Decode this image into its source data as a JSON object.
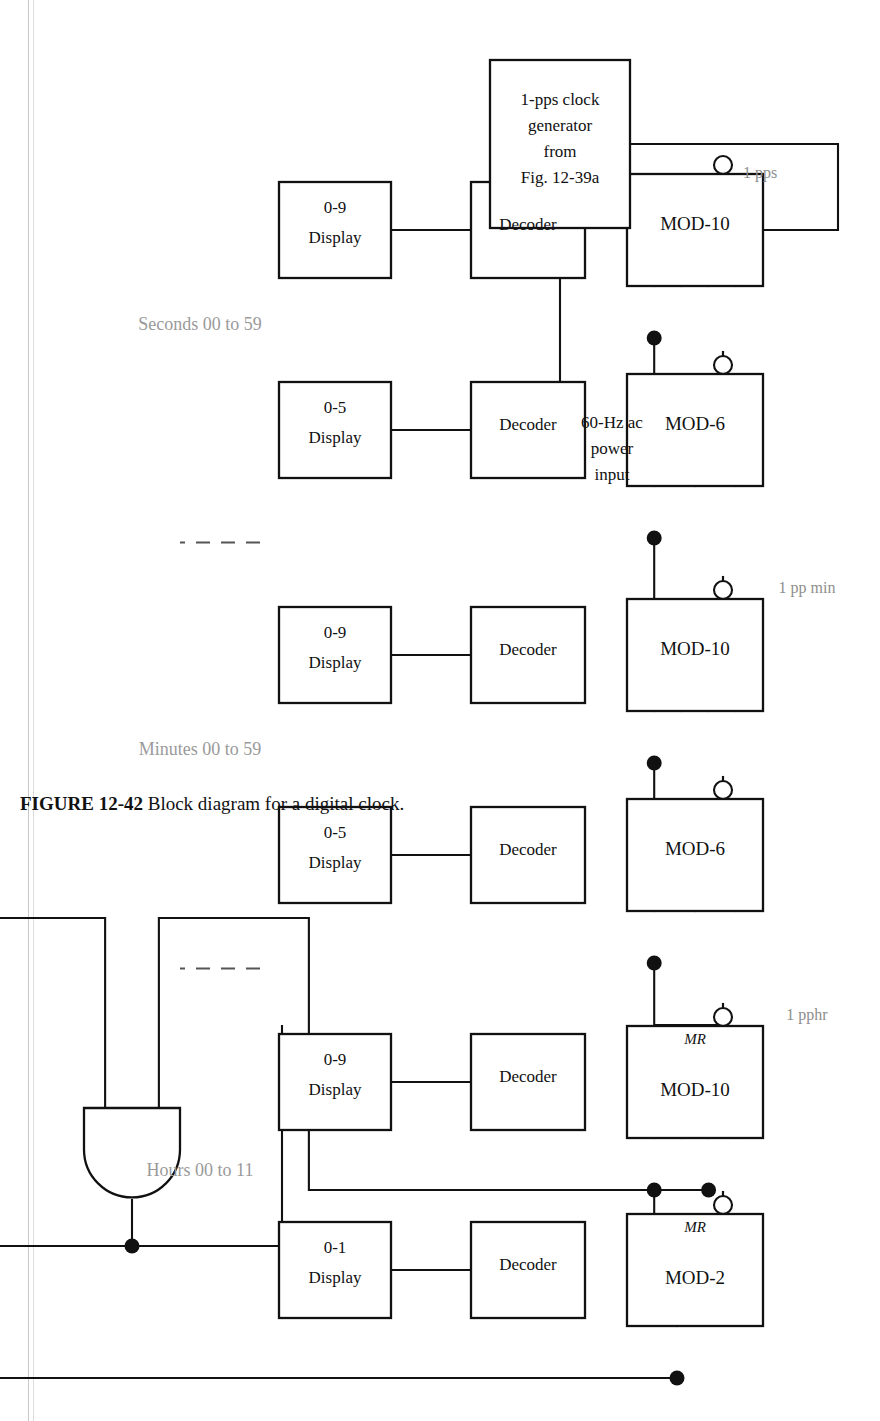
{
  "figure": {
    "caption_number": "FIGURE 12-42",
    "caption_text": "Block diagram for a digital clock."
  },
  "source": {
    "input_label_lines": [
      "60-Hz ac",
      "power",
      "input"
    ],
    "generator_lines": [
      "1-pps clock",
      "generator",
      "from",
      "Fig. 12-39a"
    ]
  },
  "signals": {
    "pps": "1 pps",
    "ppmin": "1 pp min",
    "pphr": "1 pphr"
  },
  "sections": [
    {
      "id": "seconds",
      "label": "Seconds 00 to 59"
    },
    {
      "id": "minutes",
      "label": "Minutes 00 to 59"
    },
    {
      "id": "hours",
      "label": "Hours 00 to 11"
    }
  ],
  "stages": [
    {
      "id": "seconds-units",
      "counter": "MOD-10",
      "mr": null,
      "decoder": "Decoder",
      "display_range": "0-9",
      "display_word": "Display",
      "bus_lines": 4
    },
    {
      "id": "seconds-tens",
      "counter": "MOD-6",
      "mr": null,
      "decoder": "Decoder",
      "display_range": "0-5",
      "display_word": "Display",
      "bus_lines": 3
    },
    {
      "id": "minutes-units",
      "counter": "MOD-10",
      "mr": null,
      "decoder": "Decoder",
      "display_range": "0-9",
      "display_word": "Display",
      "bus_lines": 4
    },
    {
      "id": "minutes-tens",
      "counter": "MOD-6",
      "mr": null,
      "decoder": "Decoder",
      "display_range": "0-5",
      "display_word": "Display",
      "bus_lines": 3
    },
    {
      "id": "hours-units",
      "counter": "MOD-10",
      "mr": "MR",
      "decoder": "Decoder",
      "display_range": "0-9",
      "display_word": "Display",
      "bus_lines": 4
    },
    {
      "id": "hours-tens",
      "counter": "MOD-2",
      "mr": "MR",
      "decoder": "Decoder",
      "display_range": "0-1",
      "display_word": "Display",
      "bus_lines": 1
    }
  ],
  "gate": {
    "type": "AND",
    "name": "and-gate",
    "inputs": 2
  },
  "colors": {
    "line": "#111111",
    "signal_label": "#8e8e8e",
    "section_label": "#9a9a9a",
    "page_rule": "#c9c9c9",
    "background": "#ffffff"
  }
}
